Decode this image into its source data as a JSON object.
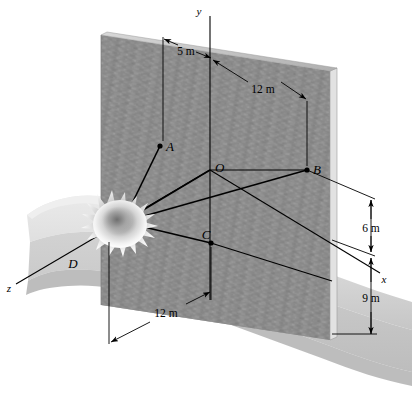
{
  "figure": {
    "kind": "engineering-mechanics-3d-diagram",
    "background_color": "#ffffff",
    "wall_color": "#8c8c8c",
    "wall_edge_color": "#c9c9c9",
    "ground_color": "#d9d9d9",
    "line_color": "#000000"
  },
  "axes": [
    {
      "id": "y",
      "label": "y",
      "x": 200,
      "y": 11
    },
    {
      "id": "x",
      "label": "x",
      "x": 384,
      "y": 279
    },
    {
      "id": "z",
      "label": "z",
      "x": 9,
      "y": 289
    }
  ],
  "points": [
    {
      "id": "A",
      "label": "A",
      "px": 160,
      "py": 146,
      "label_x": 166,
      "label_y": 146
    },
    {
      "id": "B",
      "label": "B",
      "px": 307,
      "py": 170,
      "label_x": 313,
      "label_y": 169
    },
    {
      "id": "C",
      "label": "C",
      "px": 211,
      "py": 243,
      "label_x": 206,
      "label_y": 236
    },
    {
      "id": "D",
      "label": "D",
      "px": 111,
      "py": 227,
      "label_x": 73,
      "label_y": 263
    },
    {
      "id": "O",
      "label": "O",
      "px": 210,
      "py": 170,
      "label_x": 215,
      "label_y": 167
    }
  ],
  "dimensions": [
    {
      "id": "dim-5m",
      "label": "5 m",
      "x": 186,
      "y": 51,
      "meaning": "horizontal distance from A extension line to y axis"
    },
    {
      "id": "dim-12m-top",
      "label": "12 m",
      "x": 262,
      "y": 89,
      "meaning": "horizontal distance from y axis to B along x"
    },
    {
      "id": "dim-6m",
      "label": "6 m",
      "x": 371,
      "y": 230,
      "meaning": "vertical distance from B down to x axis level"
    },
    {
      "id": "dim-9m",
      "label": "9 m",
      "x": 371,
      "y": 301,
      "meaning": "vertical distance from x axis level to the ground at the wall base"
    },
    {
      "id": "dim-12m-bottom",
      "label": "12 m",
      "x": 166,
      "y": 313,
      "meaning": "distance from D vertical line to C vertical line"
    }
  ]
}
